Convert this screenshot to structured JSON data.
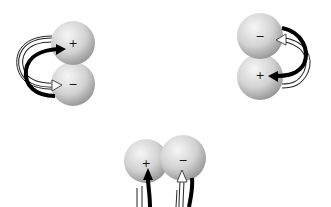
{
  "diagram": {
    "type": "dipole-pair interactions",
    "panels": [
      {
        "id": "top-left",
        "spheres": [
          {
            "charge": "+",
            "cx": 73,
            "cy": 43,
            "r": 22
          },
          {
            "charge": "−",
            "cx": 73,
            "cy": 84,
            "r": 22
          }
        ],
        "arrows": "curved loop on left side: black arrow into + sphere, white arrow into − sphere"
      },
      {
        "id": "top-right",
        "spheres": [
          {
            "charge": "−",
            "cx": 260,
            "cy": 36,
            "r": 23
          },
          {
            "charge": "+",
            "cx": 260,
            "cy": 77,
            "r": 23
          }
        ],
        "arrows": "curved loop on right side: white arrow into − sphere, black arrow into + sphere"
      },
      {
        "id": "bottom",
        "spheres": [
          {
            "charge": "+",
            "cx": 146,
            "cy": 161,
            "r": 22
          },
          {
            "charge": "−",
            "cx": 183,
            "cy": 158,
            "r": 23
          }
        ],
        "arrows": "arrows from below: black arrow up into + sphere, white arrow up into − sphere"
      }
    ],
    "colors": {
      "background": "#ffffff",
      "sphere_light": "#f4f4f4",
      "sphere_dark": "#9a9a9a",
      "arrow_dark": "#000000",
      "arrow_light": "#ffffff",
      "outline": "#222222"
    }
  },
  "labels": {
    "tl_plus": "+",
    "tl_minus": "−",
    "tr_minus": "−",
    "tr_plus": "+",
    "b_plus": "+",
    "b_minus": "−"
  }
}
